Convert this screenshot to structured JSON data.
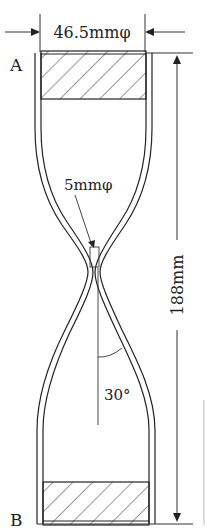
{
  "diagram": {
    "type": "technical-drawing",
    "labels": {
      "top_diameter": "46.5mmφ",
      "neck_diameter": "5mmφ",
      "total_length": "188mm",
      "angle": "30°",
      "end_top": "A",
      "end_bottom": "B"
    },
    "colors": {
      "line": "#222222",
      "background": "#ffffff"
    }
  }
}
